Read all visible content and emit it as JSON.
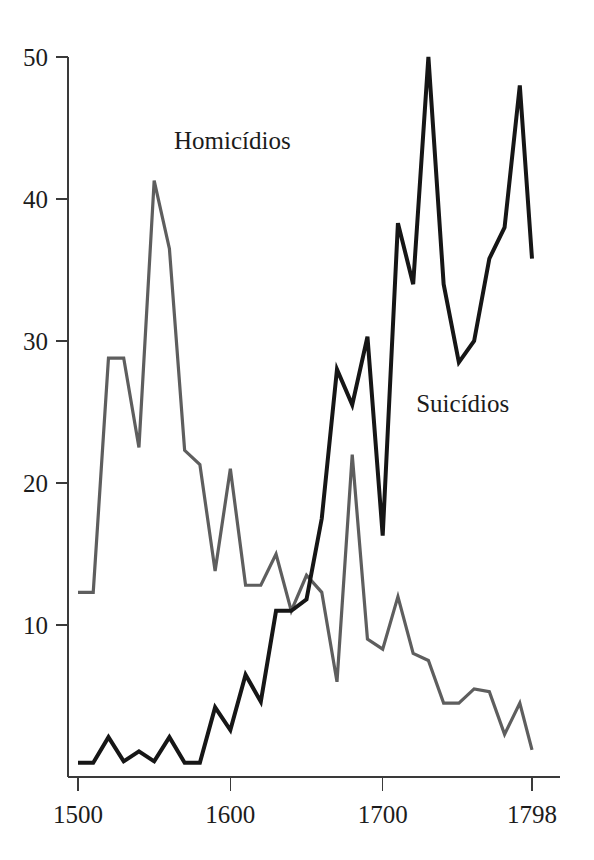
{
  "chart_data": {
    "type": "line",
    "title": "",
    "subtitle": "",
    "xlabel": "",
    "ylabel": "",
    "xlim": [
      1500,
      1798
    ],
    "ylim": [
      0,
      50
    ],
    "grid": false,
    "legend_position": "inline-annotations",
    "x_ticks": [
      1500,
      1600,
      1700,
      1798
    ],
    "x_tick_labels": [
      "1500",
      "1600",
      "1700",
      "1798"
    ],
    "y_ticks": [
      10,
      20,
      30,
      40,
      50
    ],
    "y_tick_labels": [
      "10",
      "20",
      "30",
      "40",
      "50"
    ],
    "series": [
      {
        "name": "Homicídios",
        "color": "#5e5e5e",
        "stroke_width": 3.2,
        "label_x": 1563,
        "label_y": 43.5,
        "x": [
          1500,
          1510,
          1520,
          1530,
          1540,
          1550,
          1560,
          1570,
          1580,
          1590,
          1600,
          1610,
          1620,
          1630,
          1640,
          1650,
          1660,
          1670,
          1680,
          1690,
          1700,
          1710,
          1720,
          1730,
          1740,
          1750,
          1760,
          1770,
          1780,
          1790,
          1798
        ],
        "values": [
          12.3,
          12.3,
          28.8,
          28.8,
          22.5,
          41.3,
          36.5,
          22.3,
          21.3,
          13.8,
          21.0,
          12.8,
          12.8,
          15.0,
          11.0,
          13.5,
          12.3,
          6.0,
          22.0,
          9.0,
          8.3,
          12.0,
          8.0,
          7.5,
          4.5,
          4.5,
          5.5,
          5.3,
          2.3,
          4.5,
          1.2
        ]
      },
      {
        "name": "Suicídios",
        "color": "#161616",
        "stroke_width": 4.0,
        "label_x": 1722,
        "label_y": 25.0,
        "x": [
          1500,
          1510,
          1520,
          1530,
          1540,
          1550,
          1560,
          1570,
          1580,
          1590,
          1600,
          1610,
          1620,
          1630,
          1640,
          1650,
          1660,
          1670,
          1680,
          1690,
          1700,
          1710,
          1720,
          1730,
          1740,
          1750,
          1760,
          1770,
          1780,
          1790,
          1798
        ],
        "values": [
          0.3,
          0.3,
          2.1,
          0.4,
          1.1,
          0.4,
          2.1,
          0.3,
          0.3,
          4.2,
          2.6,
          6.5,
          4.6,
          11.0,
          11.0,
          11.8,
          17.5,
          28.0,
          25.5,
          30.3,
          16.3,
          38.3,
          34.0,
          50.0,
          34.0,
          28.5,
          30.0,
          35.8,
          38.0,
          48.0,
          35.8
        ]
      }
    ],
    "annotations": [
      {
        "text": "Homicídios",
        "x": 1563,
        "y": 43.5
      },
      {
        "text": "Suicídios",
        "x": 1722,
        "y": 25.0
      }
    ]
  }
}
